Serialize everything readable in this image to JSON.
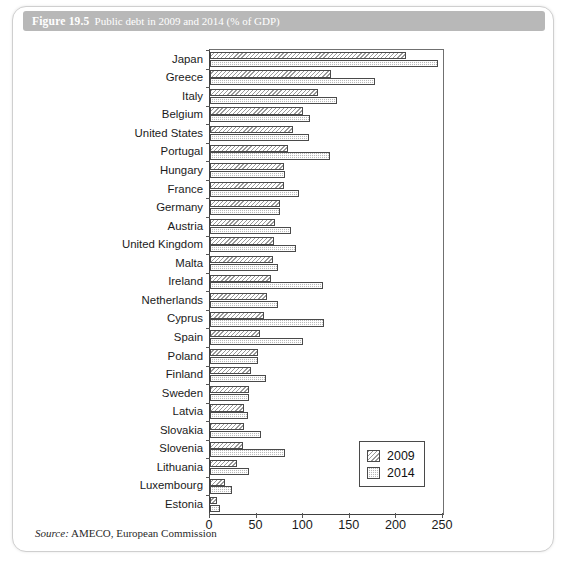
{
  "figure": {
    "number": "Figure 19.5",
    "caption": "Public debt in 2009 and 2014 (% of GDP)",
    "source_word": "Source:",
    "source_text": "AMECO, European Commission"
  },
  "legend": {
    "position": "bottom-right",
    "entries": [
      {
        "label": "2009",
        "pattern": "diagonal-hatch",
        "color": "#ffffff"
      },
      {
        "label": "2014",
        "pattern": "checkerboard",
        "color": "#b9b9b9"
      }
    ]
  },
  "chart_data": {
    "type": "bar",
    "orientation": "horizontal",
    "title": "Public debt in 2009 and 2014 (% of GDP)",
    "xlabel": "",
    "ylabel": "",
    "xlim": [
      0,
      250
    ],
    "xticks": [
      0,
      50,
      100,
      150,
      200,
      250
    ],
    "grid": false,
    "legend_position": "bottom-right",
    "categories": [
      "Japan",
      "Greece",
      "Italy",
      "Belgium",
      "United States",
      "Portugal",
      "Hungary",
      "France",
      "Germany",
      "Austria",
      "United Kingdom",
      "Malta",
      "Ireland",
      "Netherlands",
      "Cyprus",
      "Spain",
      "Poland",
      "Finland",
      "Sweden",
      "Latvia",
      "Slovakia",
      "Slovenia",
      "Lithuania",
      "Luxembourg",
      "Estonia"
    ],
    "series": [
      {
        "name": "2009",
        "values": [
          210,
          130,
          116,
          100,
          89,
          84,
          79,
          79,
          75,
          70,
          69,
          68,
          65,
          61,
          58,
          54,
          51,
          44,
          42,
          37,
          36,
          35,
          29,
          16,
          7
        ]
      },
      {
        "name": "2014",
        "values": [
          245,
          177,
          136,
          107,
          106,
          129,
          80,
          96,
          75,
          87,
          92,
          73,
          121,
          73,
          122,
          100,
          51,
          60,
          42,
          41,
          55,
          81,
          42,
          24,
          11
        ]
      }
    ]
  }
}
